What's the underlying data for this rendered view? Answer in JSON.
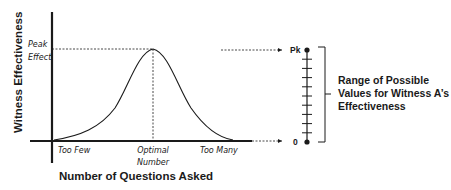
{
  "diagram": {
    "y_axis_label": "Witness Effectiveness",
    "x_axis_label": "Number of Questions Asked",
    "peak_label_line1": "Peak",
    "peak_label_line2": "Effect",
    "x_ticks": {
      "too_few": "Too Few",
      "optimal_line1": "Optimal",
      "optimal_line2": "Number",
      "too_many": "Too Many"
    },
    "scale": {
      "top_label": "Pk",
      "bottom_label": "0",
      "intermediate_ticks": 9
    },
    "range_label": {
      "line1": "Range of Possible",
      "line2": "Values for Witness A’s",
      "line3": "Effectiveness"
    },
    "colors": {
      "ink": "#1a1a1a",
      "background": "#ffffff"
    }
  }
}
